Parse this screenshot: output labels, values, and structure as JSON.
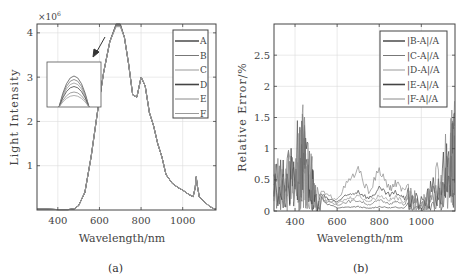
{
  "chart_data": [
    {
      "panel": "a",
      "type": "line",
      "title": "",
      "caption": "(a)",
      "xlabel": "Wavelength/nm",
      "ylabel": "Light Intensity",
      "y_multiplier": "×10^6",
      "xlim": [
        300,
        1160
      ],
      "ylim": [
        0,
        4.2
      ],
      "xticks": [
        "400",
        "600",
        "800",
        "1000"
      ],
      "yticks": [
        "1",
        "2",
        "3",
        "4"
      ],
      "grid": true,
      "legend_position": "upper right",
      "legend": [
        "A",
        "B",
        "C",
        "D",
        "E",
        "F"
      ],
      "inset": "zoom of peak near 700 nm showing curves A–F slightly separated",
      "x": [
        300,
        350,
        400,
        450,
        480,
        500,
        530,
        560,
        590,
        620,
        650,
        680,
        700,
        720,
        740,
        760,
        780,
        800,
        820,
        840,
        860,
        880,
        900,
        920,
        950,
        980,
        1000,
        1030,
        1050,
        1060,
        1065,
        1070,
        1080,
        1100,
        1130,
        1150,
        1160
      ],
      "series": [
        {
          "name": "A",
          "values": [
            0.02,
            0.02,
            0.01,
            0.01,
            0.03,
            0.1,
            0.4,
            1.2,
            2.2,
            3.1,
            3.8,
            4.2,
            4.2,
            3.9,
            3.3,
            2.6,
            2.55,
            3.0,
            2.8,
            2.2,
            1.9,
            1.5,
            1.2,
            0.8,
            0.6,
            0.5,
            0.45,
            0.35,
            0.3,
            0.5,
            0.75,
            0.55,
            0.3,
            0.2,
            0.08,
            0.03,
            0.02
          ]
        },
        {
          "name": "B",
          "values": [
            0.02,
            0.02,
            0.01,
            0.01,
            0.03,
            0.1,
            0.4,
            1.2,
            2.2,
            3.1,
            3.8,
            4.19,
            4.19,
            3.9,
            3.3,
            2.6,
            2.55,
            3.0,
            2.8,
            2.2,
            1.9,
            1.5,
            1.2,
            0.8,
            0.6,
            0.5,
            0.45,
            0.35,
            0.3,
            0.5,
            0.75,
            0.55,
            0.3,
            0.2,
            0.08,
            0.03,
            0.02
          ]
        },
        {
          "name": "C",
          "values": [
            0.02,
            0.02,
            0.01,
            0.01,
            0.03,
            0.1,
            0.4,
            1.2,
            2.2,
            3.1,
            3.8,
            4.18,
            4.18,
            3.9,
            3.3,
            2.6,
            2.55,
            3.0,
            2.8,
            2.2,
            1.9,
            1.5,
            1.2,
            0.8,
            0.6,
            0.5,
            0.45,
            0.35,
            0.3,
            0.5,
            0.75,
            0.55,
            0.3,
            0.2,
            0.08,
            0.03,
            0.02
          ]
        },
        {
          "name": "D",
          "values": [
            0.02,
            0.02,
            0.01,
            0.01,
            0.03,
            0.1,
            0.4,
            1.2,
            2.2,
            3.1,
            3.8,
            4.17,
            4.17,
            3.9,
            3.3,
            2.6,
            2.55,
            3.0,
            2.8,
            2.2,
            1.9,
            1.5,
            1.2,
            0.8,
            0.6,
            0.5,
            0.45,
            0.35,
            0.3,
            0.5,
            0.75,
            0.55,
            0.3,
            0.2,
            0.08,
            0.03,
            0.02
          ]
        },
        {
          "name": "E",
          "values": [
            0.02,
            0.02,
            0.01,
            0.01,
            0.03,
            0.1,
            0.4,
            1.2,
            2.2,
            3.1,
            3.8,
            4.16,
            4.16,
            3.9,
            3.3,
            2.6,
            2.55,
            3.0,
            2.8,
            2.2,
            1.9,
            1.5,
            1.2,
            0.8,
            0.6,
            0.5,
            0.45,
            0.35,
            0.3,
            0.5,
            0.75,
            0.55,
            0.3,
            0.2,
            0.08,
            0.03,
            0.02
          ]
        },
        {
          "name": "F",
          "values": [
            0.02,
            0.02,
            0.01,
            0.01,
            0.03,
            0.1,
            0.4,
            1.2,
            2.2,
            3.1,
            3.8,
            4.14,
            4.14,
            3.9,
            3.3,
            2.6,
            2.55,
            3.0,
            2.8,
            2.2,
            1.9,
            1.5,
            1.2,
            0.8,
            0.6,
            0.5,
            0.45,
            0.35,
            0.3,
            0.5,
            0.75,
            0.55,
            0.3,
            0.2,
            0.08,
            0.03,
            0.02
          ]
        }
      ]
    },
    {
      "panel": "b",
      "type": "line",
      "title": "",
      "caption": "(b)",
      "xlabel": "Wavelength/nm",
      "ylabel": "Relative Error/%",
      "xlim": [
        300,
        1160
      ],
      "ylim": [
        0,
        3.0
      ],
      "xticks": [
        "400",
        "600",
        "800",
        "1000"
      ],
      "yticks": [
        "0",
        "0.5",
        "1",
        "1.5",
        "2",
        "2.5"
      ],
      "grid": true,
      "legend_position": "upper right",
      "legend": [
        "|B-A|/A",
        "|C-A|/A",
        "|D-A|/A",
        "|E-A|/A",
        "|F-A|/A"
      ],
      "x": [
        300,
        350,
        400,
        430,
        450,
        480,
        500,
        550,
        600,
        650,
        700,
        750,
        800,
        850,
        880,
        920,
        950,
        1000,
        1050,
        1100,
        1140,
        1160
      ],
      "series": [
        {
          "name": "|B-A|/A",
          "values": [
            0.8,
            1.0,
            1.3,
            1.8,
            1.4,
            0.9,
            0.3,
            0.12,
            0.05,
            0.06,
            0.07,
            0.04,
            0.07,
            0.05,
            0.06,
            0.05,
            0.2,
            0.1,
            0.3,
            0.6,
            1.3,
            1.5
          ]
        },
        {
          "name": "|C-A|/A",
          "values": [
            0.7,
            0.9,
            1.2,
            1.6,
            1.3,
            0.8,
            0.3,
            0.15,
            0.1,
            0.15,
            0.17,
            0.1,
            0.17,
            0.12,
            0.15,
            0.1,
            0.3,
            0.15,
            0.4,
            0.7,
            1.4,
            1.7
          ]
        },
        {
          "name": "|D-A|/A",
          "values": [
            0.6,
            0.8,
            1.1,
            1.5,
            1.2,
            0.7,
            0.3,
            0.18,
            0.12,
            0.2,
            0.25,
            0.15,
            0.25,
            0.18,
            0.22,
            0.15,
            0.35,
            0.2,
            0.5,
            0.8,
            1.5,
            1.8
          ]
        },
        {
          "name": "|E-A|/A",
          "values": [
            0.7,
            0.9,
            1.2,
            1.7,
            1.3,
            0.8,
            0.35,
            0.2,
            0.15,
            0.25,
            0.32,
            0.2,
            0.35,
            0.25,
            0.3,
            0.2,
            0.4,
            0.25,
            0.55,
            0.9,
            1.6,
            1.9
          ]
        },
        {
          "name": "|F-A|/A",
          "values": [
            0.8,
            1.0,
            1.3,
            1.9,
            1.4,
            0.9,
            0.4,
            0.25,
            0.2,
            0.45,
            0.65,
            0.3,
            0.65,
            0.35,
            0.45,
            0.3,
            0.5,
            0.3,
            0.6,
            1.0,
            1.7,
            2.0
          ]
        }
      ]
    }
  ],
  "panel_a": {
    "ylabel": "Light Intensity",
    "xlabel": "Wavelength/nm",
    "multiplier_base": "×10",
    "multiplier_exp": "6",
    "caption": "(a)",
    "xticks": [
      "400",
      "600",
      "800",
      "1000"
    ],
    "yticks": [
      "1",
      "2",
      "3",
      "4"
    ],
    "legend": [
      "A",
      "B",
      "C",
      "D",
      "E",
      "F"
    ]
  },
  "panel_b": {
    "ylabel": "Relative Error/%",
    "xlabel": "Wavelength/nm",
    "caption": "(b)",
    "xticks": [
      "400",
      "600",
      "800",
      "1000"
    ],
    "yticks": [
      "0",
      "0.5",
      "1",
      "1.5",
      "2",
      "2.5"
    ],
    "legend": [
      "|B-A|/A",
      "|C-A|/A",
      "|D-A|/A",
      "|E-A|/A",
      "|F-A|/A"
    ]
  },
  "colors": {
    "axis": "#444444",
    "grid": "#dddddd",
    "series": [
      "#555555",
      "#777777",
      "#999999",
      "#444444",
      "#8a8a8a",
      "#9a9a9a"
    ]
  }
}
